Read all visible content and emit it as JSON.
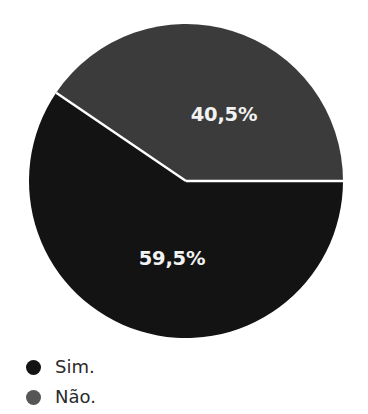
{
  "chart_data": {
    "type": "pie",
    "title": "",
    "subtitle": "",
    "xlabel": "",
    "ylabel": "",
    "grid": false,
    "legend_position": "bottom-left",
    "categories": [
      "Sim.",
      "Não."
    ],
    "values": [
      59.5,
      40.5
    ],
    "value_labels": [
      "59,5%",
      "40,5%"
    ],
    "colors": [
      "#131313",
      "#3b3b3b"
    ],
    "slices": [
      {
        "name": "Sim.",
        "value": 59.5,
        "label": "59,5%",
        "color": "#131313",
        "start_angle_deg": 145.8,
        "end_angle_deg": 360.0,
        "label_x": 172,
        "label_y": 265
      },
      {
        "name": "Não.",
        "value": 40.5,
        "label": "40,5%",
        "color": "#3b3b3b",
        "start_angle_deg": 0.0,
        "end_angle_deg": 145.8,
        "label_x": 224,
        "label_y": 121
      }
    ],
    "separator_color": "#ffffff",
    "background": "#ffffff",
    "center_x": 186,
    "center_y": 181,
    "radius": 157
  },
  "legend": {
    "items": [
      {
        "label": "Sim.",
        "color": "#131313"
      },
      {
        "label": "Não.",
        "color": "#565656"
      }
    ]
  }
}
